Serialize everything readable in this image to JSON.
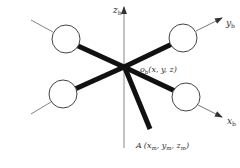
{
  "diagram": {
    "type": "quadrotor-body-frame",
    "axes": {
      "z": {
        "label": "z",
        "sub": "b"
      },
      "y": {
        "label": "y",
        "sub": "b"
      },
      "x": {
        "label": "x",
        "sub": "b"
      }
    },
    "origin": {
      "name": "o",
      "sub": "b",
      "coords": "(x, y, z)"
    },
    "point_a": {
      "name": "A",
      "coords_open": "(x",
      "x_sub": "m",
      "sep1": ", y",
      "y_sub": "m",
      "sep2": ", z",
      "z_sub": "m",
      "close": ")"
    },
    "rotors": [
      "front-left",
      "front-right",
      "rear-left",
      "rear-right"
    ],
    "colors": {
      "arm": "#111111",
      "axis": "#888888",
      "rotor_stroke": "#444444",
      "text": "#333333"
    }
  }
}
